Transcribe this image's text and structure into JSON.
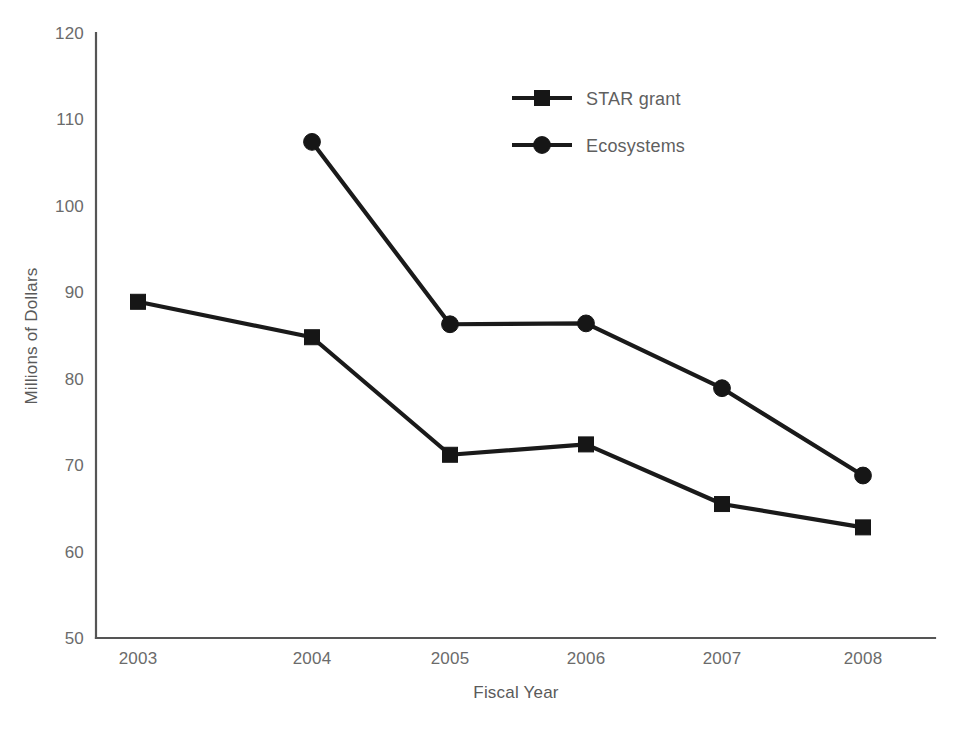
{
  "chart_data": {
    "type": "line",
    "title": "",
    "xlabel": "Fiscal Year",
    "ylabel": "Millions of Dollars",
    "categories": [
      "2003",
      "2004",
      "2005",
      "2006",
      "2007",
      "2008"
    ],
    "series": [
      {
        "name": "STAR grant",
        "marker": "square",
        "values": [
          88.9,
          84.8,
          71.2,
          72.4,
          65.5,
          62.8
        ]
      },
      {
        "name": "Ecosystems",
        "marker": "circle",
        "values": [
          null,
          107.4,
          86.3,
          86.4,
          78.9,
          68.8
        ]
      }
    ],
    "ylim": [
      50,
      120
    ],
    "yticks": [
      50,
      60,
      70,
      80,
      90,
      100,
      110,
      120
    ],
    "ytick_labels": [
      "50",
      "60",
      "70",
      "80",
      "90",
      "100",
      "110",
      "120"
    ],
    "grid": false,
    "legend_position": "top-center",
    "colors": {
      "line": "#1a1a1a",
      "marker": "#161616",
      "axis": "#555555",
      "text": "#5f5f5f",
      "background": "#ffffff"
    }
  },
  "legend": {
    "entries": [
      {
        "label": "STAR grant",
        "marker": "square"
      },
      {
        "label": "Ecosystems",
        "marker": "circle"
      }
    ]
  }
}
